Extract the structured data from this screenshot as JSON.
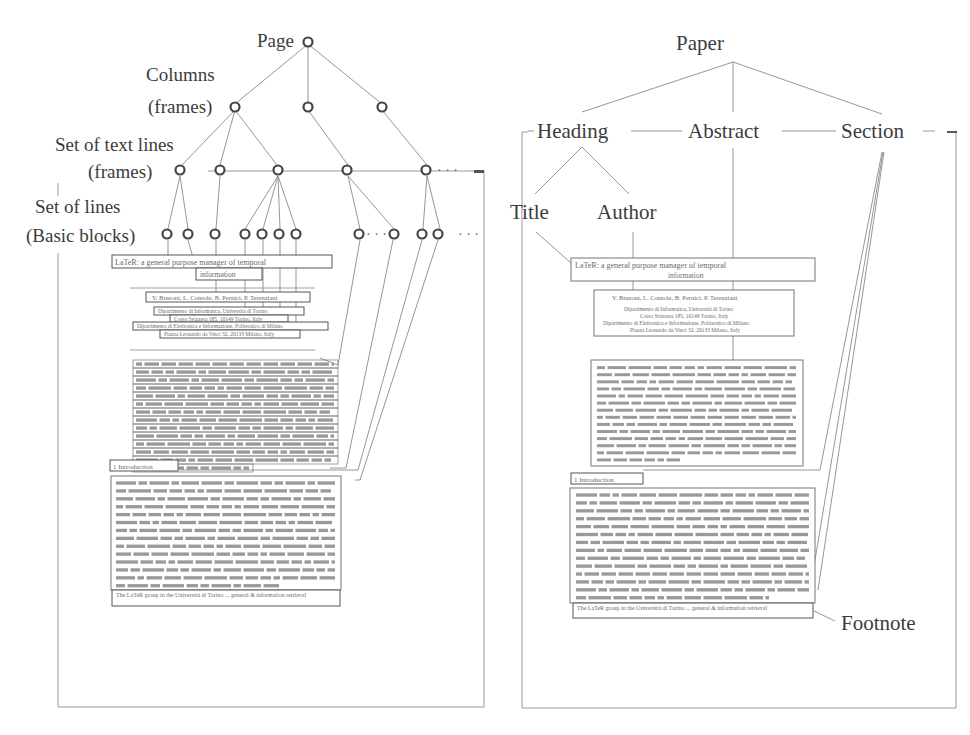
{
  "left_panel": {
    "name": "physical-layout-tree",
    "levels": [
      {
        "label": "Page",
        "lines": [
          "Page"
        ]
      },
      {
        "label": "Columns (frames)",
        "lines": [
          "Columns",
          "(frames)"
        ]
      },
      {
        "label": "Set of text lines (frames)",
        "lines": [
          "Set of text lines",
          "(frames)"
        ]
      },
      {
        "label": "Set of lines (Basic blocks)",
        "lines": [
          "Set of lines",
          "(Basic blocks)"
        ]
      }
    ],
    "ellipsis": "· · ·",
    "document": {
      "title_line1": "LaTeR: a general purpose manager of temporal",
      "title_line2": "information",
      "authors": "V. Brusoni, L. Console, B. Pernici, P. Terenziani",
      "affiliation_lines": [
        "Dipartimento di Informatica, Università di Torino",
        "Corso Svizzera 185, 10149 Torino, Italy",
        "Dipartimento di Elettronica e Informazione, Politecnico di Milano",
        "Piazza Leonardo da Vinci 32, 20133 Milano, Italy"
      ],
      "section_heading": "1   Introduction",
      "footnote": "The LaTeR group in the Università di Torino ... general & information retrieval"
    }
  },
  "right_panel": {
    "name": "logical-structure-tree",
    "root": "Paper",
    "children": [
      "Heading",
      "Abstract",
      "Section"
    ],
    "heading_children": [
      "Title",
      "Author"
    ],
    "footnote_label": "Footnote",
    "document": {
      "title_line1": "LaTeR: a general purpose manager of temporal",
      "title_line2": "information",
      "authors": "V. Brusoni, L. Console, B. Pernici, P. Terenziani",
      "affiliation_lines": [
        "Dipartimento di Informatica, Università di Torino",
        "Corso Svizzera 185, 10149 Torino, Italy",
        "Dipartimento di Elettronica e Informazione, Politecnico di Milano",
        "Piazza Leonardo da Vinci 32, 20133 Milano, Italy"
      ],
      "section_heading": "1   Introduction",
      "footnote": "The LaTeR group in the Università di Torino ... general & information retrieval"
    }
  }
}
